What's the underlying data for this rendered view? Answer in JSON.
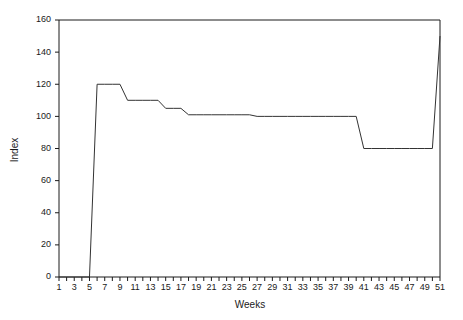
{
  "chart_data": {
    "type": "line",
    "title": "",
    "subtitle": "",
    "xlabel": "Weeks",
    "ylabel": "Index",
    "grid": false,
    "legend": null,
    "legend_position": "none",
    "xlim": [
      1,
      51
    ],
    "ylim": [
      0,
      160
    ],
    "x_tick_step": 1,
    "x_label_step": 2,
    "y_tick_step": 20,
    "x_tick_labels": [
      "1",
      "3",
      "5",
      "7",
      "9",
      "11",
      "13",
      "15",
      "17",
      "19",
      "21",
      "23",
      "25",
      "27",
      "29",
      "31",
      "33",
      "35",
      "37",
      "39",
      "41",
      "43",
      "45",
      "47",
      "49",
      "51"
    ],
    "y_tick_labels": [
      "0",
      "20",
      "40",
      "60",
      "80",
      "100",
      "120",
      "140",
      "160"
    ],
    "series": [
      {
        "name": "Index",
        "color": "#333333",
        "x": [
          1,
          2,
          3,
          4,
          5,
          6,
          7,
          8,
          9,
          10,
          11,
          12,
          13,
          14,
          15,
          16,
          17,
          18,
          19,
          20,
          21,
          22,
          23,
          24,
          25,
          26,
          27,
          28,
          29,
          30,
          31,
          32,
          33,
          34,
          35,
          36,
          37,
          38,
          39,
          40,
          41,
          42,
          43,
          44,
          45,
          46,
          47,
          48,
          49,
          50,
          51
        ],
        "values": [
          0,
          0,
          0,
          0,
          0,
          120,
          120,
          120,
          120,
          110,
          110,
          110,
          110,
          110,
          105,
          105,
          105,
          101,
          101,
          101,
          101,
          101,
          101,
          101,
          101,
          101,
          100,
          100,
          100,
          100,
          100,
          100,
          100,
          100,
          100,
          100,
          100,
          100,
          100,
          100,
          80,
          80,
          80,
          80,
          80,
          80,
          80,
          80,
          80,
          80,
          150
        ]
      }
    ]
  },
  "axis": {
    "y_title": "Index",
    "x_title": "Weeks"
  }
}
